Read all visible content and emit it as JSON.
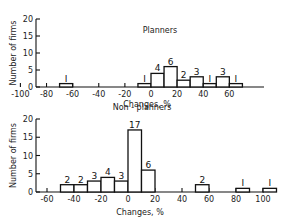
{
  "chart_data": [
    {
      "type": "bar",
      "title": "Planners",
      "xlabel": "Changes, %",
      "ylabel": "Number of firms",
      "ylim": [
        0,
        20
      ],
      "yticks": [
        "0",
        "5",
        "10",
        "15",
        "20"
      ],
      "xticks": [
        "-100",
        "-80",
        "-60",
        "-40",
        "-20",
        "0",
        "20",
        "40",
        "60"
      ],
      "bins": [
        {
          "from": -70,
          "to": -60,
          "value": 1
        },
        {
          "from": -10,
          "to": 0,
          "value": 1
        },
        {
          "from": 0,
          "to": 10,
          "value": 4
        },
        {
          "from": 10,
          "to": 20,
          "value": 6
        },
        {
          "from": 20,
          "to": 30,
          "value": 2
        },
        {
          "from": 30,
          "to": 40,
          "value": 3
        },
        {
          "from": 40,
          "to": 50,
          "value": 1
        },
        {
          "from": 50,
          "to": 60,
          "value": 3
        },
        {
          "from": 60,
          "to": 70,
          "value": 1
        }
      ]
    },
    {
      "type": "bar",
      "title": "Non - planners",
      "xlabel": "Changes, %",
      "ylabel": "Number of firms",
      "ylim": [
        0,
        20
      ],
      "yticks": [
        "0",
        "5",
        "10",
        "15",
        "20"
      ],
      "xticks": [
        "-60",
        "-40",
        "-20",
        "0",
        "20",
        "40",
        "60",
        "80",
        "100"
      ],
      "bins": [
        {
          "from": -50,
          "to": -40,
          "value": 2
        },
        {
          "from": -40,
          "to": -30,
          "value": 2
        },
        {
          "from": -30,
          "to": -20,
          "value": 3
        },
        {
          "from": -20,
          "to": -10,
          "value": 4
        },
        {
          "from": -10,
          "to": 0,
          "value": 3
        },
        {
          "from": 0,
          "to": 10,
          "value": 17
        },
        {
          "from": 10,
          "to": 20,
          "value": 6
        },
        {
          "from": 50,
          "to": 60,
          "value": 2
        },
        {
          "from": 80,
          "to": 90,
          "value": 1
        },
        {
          "from": 100,
          "to": 110,
          "value": 1
        }
      ]
    }
  ]
}
